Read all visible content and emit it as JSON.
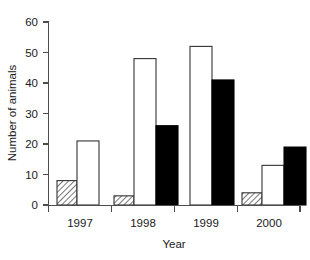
{
  "chart_data": {
    "type": "bar",
    "title": "",
    "xlabel": "Year",
    "ylabel": "Number of animals",
    "categories": [
      "1997",
      "1998",
      "1999",
      "2000"
    ],
    "ylim": [
      0,
      60
    ],
    "yticks": [
      0,
      10,
      20,
      30,
      40,
      50,
      60
    ],
    "ytick_labels": [
      "0",
      "10",
      "20",
      "30",
      "40",
      "50",
      "60"
    ],
    "grid": false,
    "legend": "none",
    "series": [
      {
        "name": "hatched",
        "style": "diagonal-hatch",
        "color": "#ffffff",
        "values": [
          8,
          3,
          null,
          4
        ]
      },
      {
        "name": "open",
        "style": "open-white",
        "color": "#ffffff",
        "values": [
          21,
          48,
          52,
          13
        ]
      },
      {
        "name": "filled",
        "style": "solid-black",
        "color": "#000000",
        "values": [
          null,
          26,
          41,
          19
        ]
      }
    ]
  },
  "axis": {
    "y_title": "Number of animals",
    "x_title": "Year",
    "y_tick_0": "0",
    "y_tick_1": "10",
    "y_tick_2": "20",
    "y_tick_3": "30",
    "y_tick_4": "40",
    "y_tick_5": "50",
    "y_tick_6": "60",
    "x_tick_0": "1997",
    "x_tick_1": "1998",
    "x_tick_2": "1999",
    "x_tick_3": "2000"
  }
}
